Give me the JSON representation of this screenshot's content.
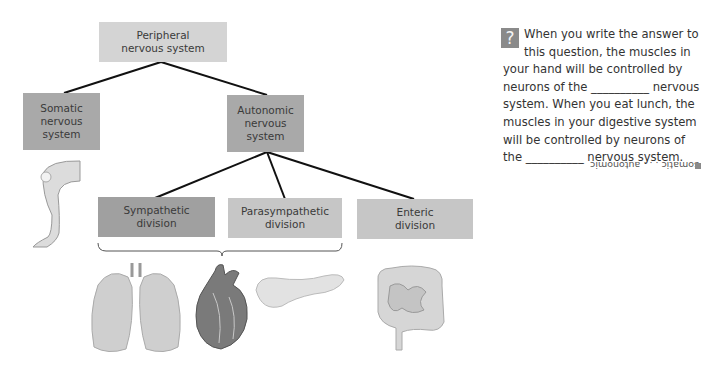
{
  "diagram": {
    "root": {
      "label": "Peripheral\nnervous system"
    },
    "level1": [
      {
        "label": "Somatic\nnervous\nsystem"
      },
      {
        "label": "Autonomic\nnervous\nsystem"
      }
    ],
    "level2": [
      {
        "label": "Sympathetic\ndivision"
      },
      {
        "label": "Parasympathetic\ndivision"
      },
      {
        "label": "Enteric\ndivision"
      }
    ],
    "illustrations": [
      "leg",
      "lungs",
      "heart",
      "pancreas",
      "intestines"
    ]
  },
  "question": {
    "icon": "?",
    "text": "When you write the answer to this question, the muscles in your hand will be controlled by neurons of the __________ nervous system. When you eat lunch, the muscles in your digestive system will be controlled by neurons of the __________ nervous system.",
    "answer": "somatic . . . autonomic"
  }
}
